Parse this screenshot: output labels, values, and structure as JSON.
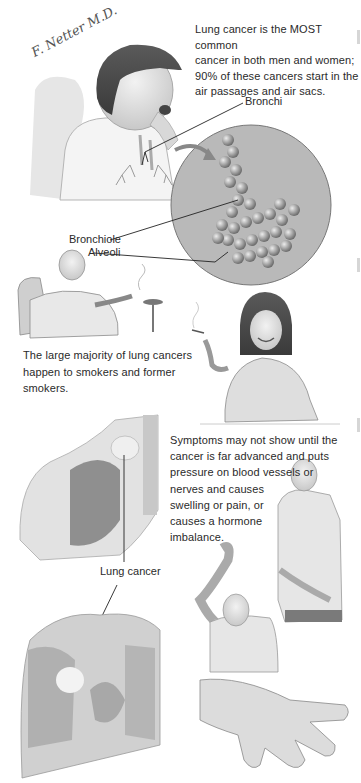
{
  "signature": "F. Netter M.D.",
  "section1": {
    "caption": "Lung cancer is the MOST common cancer in both men and women; 90% of these cancers start in the air passages and air sacs.",
    "caption_lines": [
      "Lung cancer is the MOST common",
      "cancer in both men and women;",
      "90% of these cancers start in the",
      "air passages and air sacs."
    ],
    "labels": {
      "bronchi": "Bronchi",
      "bronchiole": "Bronchiole",
      "alveoli": "Alveoli"
    },
    "illustrations": [
      "woman-coughing-with-lungs",
      "magnified-alveoli-circle"
    ]
  },
  "section2": {
    "caption_lines": [
      "The large majority of lung cancers",
      "happen to smokers and former",
      "smokers."
    ],
    "illustrations": [
      "man-smoking-in-armchair",
      "woman-smoking-cigarette"
    ]
  },
  "section3": {
    "caption_lines": [
      "Symptoms may not show until the",
      "cancer is far advanced and puts",
      "pressure on blood vessels or",
      "nerves and causes",
      "swelling or pain, or",
      "causes a hormone",
      "imbalance."
    ],
    "labels": {
      "lung_cancer": "Lung cancer"
    },
    "illustrations": [
      "shoulder-tumor-cutaway",
      "chest-cutaway-with-tumor",
      "man-holding-arm",
      "man-raising-arm",
      "clubbed-fingers-hand"
    ]
  },
  "colors": {
    "text": "#2a2a2a",
    "circle_fill": "#b9b9b9",
    "illustration_gray": "#8a8a8a"
  }
}
